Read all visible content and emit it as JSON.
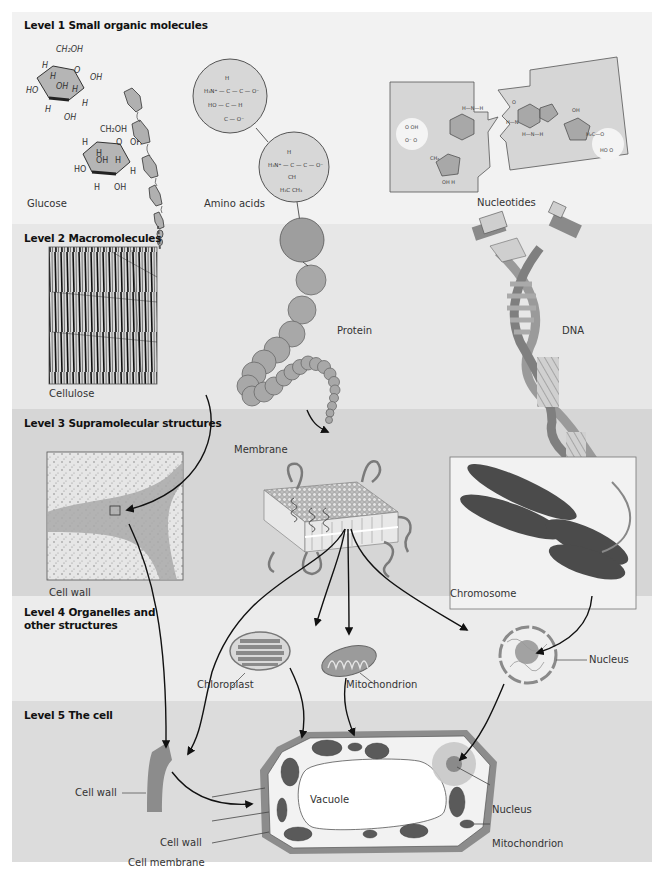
{
  "diagram": {
    "colors": {
      "level1_bg": "#f2f2f2",
      "level2_bg": "#e7e7e7",
      "level3_bg": "#d6d6d6",
      "level4_bg": "#ececec",
      "level5_bg": "#dcdcdc",
      "molecule_fill": "#b5b5b5",
      "wall_fill": "#8c8c8c",
      "arrow": "#111111"
    },
    "levels": [
      {
        "id": 1,
        "title": "Level 1 Small organic molecules"
      },
      {
        "id": 2,
        "title": "Level 2 Macromolecules"
      },
      {
        "id": 3,
        "title": "Level 3 Supramolecular structures"
      },
      {
        "id": 4,
        "title_line1": "Level 4 Organelles and",
        "title_line2": "other structures"
      },
      {
        "id": 5,
        "title": "Level 5 The cell"
      }
    ],
    "level1": {
      "glucose_label": "Glucose",
      "amino_acids_label": "Amino acids",
      "nucleotides_label": "Nucleotides",
      "glucose_atoms": {
        "ch2oh": "CH₂OH",
        "h": "H",
        "oh": "OH",
        "ho": "HO",
        "o": "O"
      },
      "amino_acid_1": {
        "line1": "H",
        "line2": "H₃N⁺ — C — C — O⁻",
        "line3": "HO — C — H",
        "line4": "C — O⁻"
      },
      "amino_acid_2": {
        "line1": "H",
        "line2": "H₃N⁺ — C — C — O⁻",
        "line3": "CH",
        "line4": "H₃C  CH₃"
      }
    },
    "level2": {
      "cellulose_label": "Cellulose",
      "protein_label": "Protein",
      "dna_label": "DNA"
    },
    "level3": {
      "cell_wall_label": "Cell wall",
      "membrane_label": "Membrane",
      "chromosome_label": "Chromosome"
    },
    "level4": {
      "chloroplast_label": "Chloroplast",
      "mitochondrion_label": "Mitochondrion",
      "nucleus_label": "Nucleus"
    },
    "level5": {
      "cell_wall_fragment_label": "Cell wall",
      "vacuole_label": "Vacuole",
      "cell_wall_label": "Cell wall",
      "cell_membrane_label": "Cell membrane",
      "chloroplast_label": "Chloroplast",
      "nucleus_label": "Nucleus",
      "mitochondrion_label": "Mitochondrion"
    }
  }
}
